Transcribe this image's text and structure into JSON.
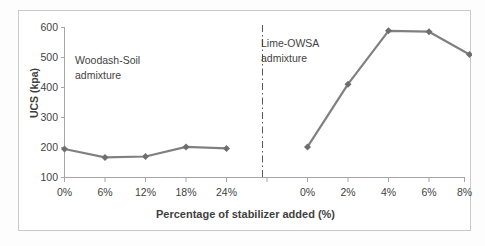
{
  "chart_data": {
    "type": "line",
    "title": "",
    "subtitle": "",
    "xlabel": "Percentage of stabilizer added (%)",
    "ylabel": "UCS (kpa)",
    "ylim": [
      100,
      600
    ],
    "ytick_labels": [
      "600",
      "500",
      "400",
      "300",
      "200",
      "100"
    ],
    "ytick_values": [
      600,
      500,
      400,
      300,
      200,
      100
    ],
    "grid": false,
    "legend": "none",
    "series": [
      {
        "name": "Woodash-Soil admixture",
        "categories": [
          "0%",
          "6%",
          "12%",
          "18%",
          "24%"
        ],
        "values": [
          195,
          167,
          170,
          202,
          197
        ]
      },
      {
        "name": "Lime-OWSA admixture",
        "categories": [
          "0%",
          "2%",
          "4%",
          "6%",
          "8%"
        ],
        "values": [
          202,
          411,
          589,
          586,
          510
        ]
      }
    ],
    "annotations": [
      {
        "id": "annot-left",
        "line1": "Woodash-Soil",
        "line2": "admixture"
      },
      {
        "id": "annot-right",
        "line1": "Lime-OWSA",
        "line2": "admixture"
      }
    ],
    "divider": {
      "style": "dash-dot",
      "orientation": "vertical",
      "color": "#595959"
    },
    "colors": {
      "line": "#808080",
      "marker": "#6e6e6e",
      "axis": "#a6a6a6",
      "text": "#3f3f3f",
      "frame": "#c9c9c9",
      "background": "#ffffff"
    }
  },
  "axis_tick_text": {
    "y": {
      "t600": "600",
      "t500": "500",
      "t400": "400",
      "t300": "300",
      "t200": "200",
      "t100": "100"
    },
    "x_left": {
      "t0": "0%",
      "t1": "6%",
      "t2": "12%",
      "t3": "18%",
      "t4": "24%"
    },
    "x_right": {
      "t0": "0%",
      "t1": "2%",
      "t2": "4%",
      "t3": "6%",
      "t4": "8%"
    }
  },
  "titles": {
    "x_axis": "Percentage of stabilizer added (%)",
    "y_axis": "UCS (kpa)"
  },
  "annotation_text": {
    "left_line1": "Woodash-Soil",
    "left_line2": "admixture",
    "right_line1": "Lime-OWSA",
    "right_line2": "admixture"
  }
}
